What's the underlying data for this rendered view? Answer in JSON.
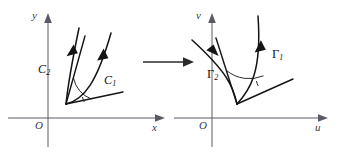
{
  "figure": {
    "type": "diagram",
    "background_color": "#ffffff",
    "axis_color": "#5a5a66",
    "curve_color": "#141414"
  },
  "left_plane": {
    "name": "xy-plane",
    "y_axis_label": "y",
    "x_axis_label": "x",
    "origin_label": "O",
    "curves": [
      {
        "id": "c1",
        "label": "C",
        "subscript": "1"
      },
      {
        "id": "c2",
        "label": "C",
        "subscript": "2"
      }
    ]
  },
  "right_plane": {
    "name": "uv-plane",
    "y_axis_label": "v",
    "x_axis_label": "u",
    "origin_label": "O",
    "curves": [
      {
        "id": "g1",
        "label": "Γ",
        "subscript": "1"
      },
      {
        "id": "g2",
        "label": "Γ",
        "subscript": "2"
      }
    ]
  },
  "transform_arrow": {
    "name": "mapping-arrow",
    "direction": "left-to-right",
    "label": ""
  }
}
